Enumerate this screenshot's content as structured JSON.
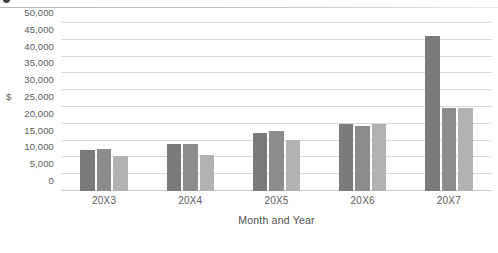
{
  "header": {
    "bullet_icon": "dot-icon",
    "clipped_title": "",
    "divider": "horizontal-rule"
  },
  "chart_data": {
    "type": "bar",
    "title": "",
    "subtitle": "",
    "xlabel": "Month and Year",
    "ylabel": "$",
    "ylim": [
      0,
      50000
    ],
    "ytick_step": 5000,
    "grid": true,
    "legend": "none",
    "categories": [
      "20X3",
      "20X4",
      "20X5",
      "20X6",
      "20X7"
    ],
    "ytick_labels": [
      "50,000",
      "45,000",
      "40,000",
      "35,000",
      "30,000",
      "25,000",
      "20,000",
      "15,000",
      "10,000",
      "5,000",
      "0"
    ],
    "ytick_values": [
      50000,
      45000,
      40000,
      35000,
      30000,
      25000,
      20000,
      15000,
      10000,
      5000,
      0
    ],
    "unit_label_at_value": 25000,
    "series": [
      {
        "name": "Series 1",
        "color": "#7a7a7a",
        "values": [
          12300,
          13900,
          17200,
          20000,
          46000
        ]
      },
      {
        "name": "Series 2",
        "color": "#8c8c8c",
        "values": [
          12400,
          14100,
          18000,
          19400,
          24800
        ]
      },
      {
        "name": "Series 3",
        "color": "#b2b2b2",
        "values": [
          10500,
          10800,
          15100,
          19900,
          24700
        ]
      }
    ]
  },
  "colors": {
    "background": "#ffffff",
    "gridline": "#d9d9d9",
    "axis_text": "#5a5a5a",
    "title_text": "#4f4f4f",
    "series_1": "#7a7a7a",
    "series_2": "#8c8c8c",
    "series_3": "#b2b2b2"
  }
}
